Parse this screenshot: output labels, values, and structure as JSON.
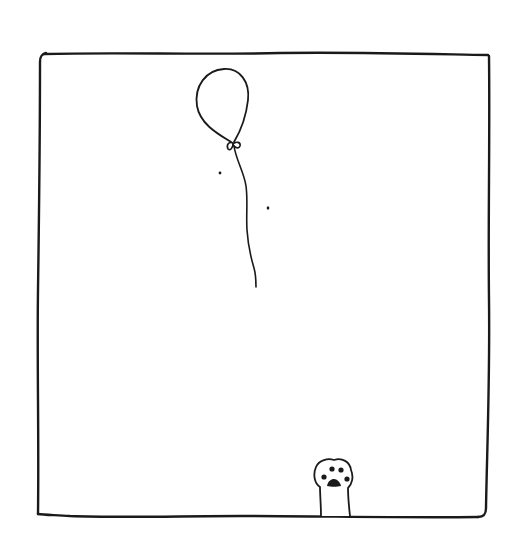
{
  "illustration": {
    "style": "hand-drawn ink sketch",
    "background_color": "#ffffff",
    "ink_color": "#1a1a1a",
    "elements": [
      {
        "name": "frame",
        "description": "sketchy rectangular panel border"
      },
      {
        "name": "balloon",
        "description": "floating balloon with tied knot and wavy string"
      },
      {
        "name": "specks",
        "description": "two small ink dots near the balloon string"
      },
      {
        "name": "cat-paw",
        "description": "cat paw reaching up from the bottom edge with toe beans"
      }
    ]
  }
}
